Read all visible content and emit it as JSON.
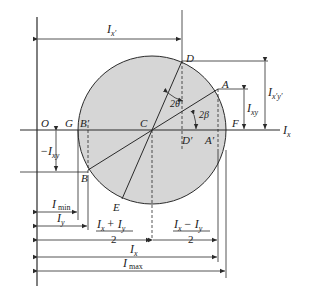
{
  "colors": {
    "circle_fill": "#d6d6d6",
    "line": "#2a2a2a",
    "background": "#ffffff"
  },
  "points": {
    "O": "O",
    "G": "G",
    "B_prime": "B′",
    "C": "C",
    "D": "D",
    "D_prime": "D′",
    "A": "A",
    "A_prime": "A′",
    "F": "F",
    "B": "B",
    "E": "E"
  },
  "labels": {
    "axis_x": "I",
    "axis_x_sub": "x",
    "I_x_prime": "I",
    "I_x_prime_sub": "x′",
    "angle_2theta": "2θ",
    "angle_2beta": "2β",
    "I_xy": "I",
    "I_xy_sub": "xy",
    "I_xpyp": "I",
    "I_xpyp_sub": "x′y′",
    "neg_I_xy": "−I",
    "neg_I_xy_sub": "xy",
    "I_min": "I",
    "I_min_sub": "min",
    "I_y": "I",
    "I_y_sub": "y",
    "sum_num": "I",
    "sum_num_x": "x",
    "sum_plus": "+ I",
    "sum_num_y": "y",
    "sum_den": "2",
    "diff_num": "I",
    "diff_num_x": "x",
    "diff_minus": "− I",
    "diff_num_y": "y",
    "diff_den": "2",
    "I_x_dim": "I",
    "I_x_dim_sub": "x",
    "I_max": "I",
    "I_max_sub": "max"
  }
}
